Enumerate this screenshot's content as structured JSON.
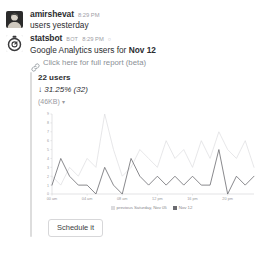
{
  "messages": [
    {
      "author": "amirshevat",
      "time": "8:29 PM",
      "text": "users yesterday",
      "avatar_icon": "user-photo-avatar"
    },
    {
      "author": "statsbot",
      "bot_tag": "BOT",
      "time": "8:29 PM",
      "head_glyph": "○",
      "avatar_icon": "statsbot-robot-avatar"
    }
  ],
  "attachment": {
    "title_prefix": "Google Analytics users for ",
    "title_date": "Nov 12",
    "link_icon": "link-icon",
    "link_text": "Click here for full report (beta)",
    "stat_main": "22 users",
    "stat_delta": "↓ 31.25% (32)",
    "size_label": "(46KB)",
    "size_caret": "▾",
    "bar_color": "#dddddd"
  },
  "footer": {
    "schedule_label": "Schedule it"
  },
  "chart_data": {
    "type": "line",
    "title": "",
    "xlabel": "",
    "ylabel": "",
    "grid": false,
    "legend_position": "bottom",
    "ylim": [
      0,
      9
    ],
    "yticks": [
      0,
      1,
      2,
      3,
      4,
      5,
      6,
      7,
      8,
      9
    ],
    "ytick_labels": [
      "0",
      "1",
      "2",
      "3",
      "4",
      "5",
      "6",
      "7",
      "8",
      "9"
    ],
    "x": [
      "00 am",
      "01 am",
      "02 am",
      "03 am",
      "04 am",
      "05 am",
      "06 am",
      "07 am",
      "08 am",
      "09 am",
      "10 am",
      "11 am",
      "12 pm",
      "13 pm",
      "14 pm",
      "15 pm",
      "16 pm",
      "17 pm",
      "18 pm",
      "19 pm",
      "20 pm",
      "21 pm",
      "22 pm",
      "23 pm"
    ],
    "xtick_labels": [
      "00 am",
      "04 am",
      "08 am",
      "12 pm",
      "16 pm",
      "20 pm"
    ],
    "xtick_indices": [
      0,
      4,
      8,
      12,
      16,
      20
    ],
    "series": [
      {
        "name": "Nov 12",
        "color": "#6b6b70",
        "values": [
          1,
          4,
          2,
          1,
          1,
          0,
          3,
          1,
          0,
          4,
          2,
          1,
          2,
          1,
          2,
          1,
          2,
          1,
          1,
          5,
          0,
          2,
          1,
          2
        ]
      },
      {
        "name": "previous Saturday, Nov 05",
        "color": "#dcdcdf",
        "values": [
          2,
          1,
          3,
          2,
          4,
          3,
          9,
          5,
          2,
          3,
          5,
          4,
          3,
          6,
          4,
          5,
          3,
          6,
          4,
          7,
          5,
          4,
          6,
          3
        ]
      }
    ],
    "legend": [
      {
        "label": "previous Saturday, Nov 05",
        "color": "#dcdcdf"
      },
      {
        "label": "Nov 12",
        "color": "#6b6b70"
      }
    ]
  }
}
